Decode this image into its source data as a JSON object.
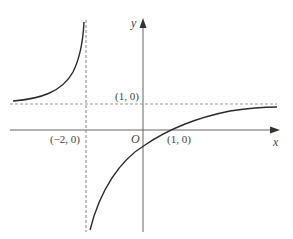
{
  "figure": {
    "type": "function graph",
    "axes": {
      "x_label": "x",
      "y_label": "y",
      "origin_label": "O"
    },
    "annotations": {
      "vertical_asymptote_point": "(−2, 0)",
      "horizontal_asymptote_label": "(1, 0)",
      "x_intercept_label": "(1, 0)"
    },
    "asymptotes": {
      "vertical": "x = -2",
      "horizontal": "y = 1"
    },
    "colors": {
      "curve": "#2a2a2a",
      "axes": "#555555",
      "asymptote": "#888888",
      "text": "#444444"
    }
  }
}
